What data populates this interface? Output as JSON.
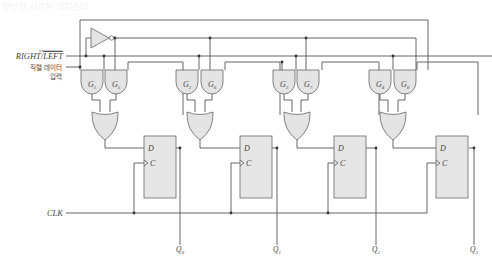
{
  "title": "양방향 시프트 레지스터",
  "inputs": {
    "direction_label_main": "RIGHT/",
    "direction_label_bar": "LEFT",
    "serial_label_line1": "직렬 데이터",
    "serial_label_line2": "입력",
    "clock_label": "CLK"
  },
  "stages": [
    {
      "and_a": "G",
      "and_a_sub": "1",
      "and_b": "G",
      "and_b_sub": "5",
      "ff_d": "D",
      "ff_c": "C",
      "output": "Q",
      "output_sub": "0"
    },
    {
      "and_a": "G",
      "and_a_sub": "2",
      "and_b": "G",
      "and_b_sub": "6",
      "ff_d": "D",
      "ff_c": "C",
      "output": "Q",
      "output_sub": "1"
    },
    {
      "and_a": "G",
      "and_a_sub": "3",
      "and_b": "G",
      "and_b_sub": "7",
      "ff_d": "D",
      "ff_c": "C",
      "output": "Q",
      "output_sub": "2"
    },
    {
      "and_a": "G",
      "and_a_sub": "4",
      "and_b": "G",
      "and_b_sub": "8",
      "ff_d": "D",
      "ff_c": "C",
      "output": "Q",
      "output_sub": "3"
    }
  ],
  "colors": {
    "wire": "#555555",
    "gate_fill": "#e4e4e4",
    "ff_fill": "#e6e6e6"
  }
}
